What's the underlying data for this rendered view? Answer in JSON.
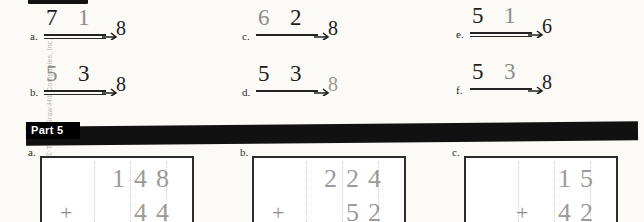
{
  "page": {
    "copyright": "Copyright © The McGraw-Hill Companies, Inc."
  },
  "part4": {
    "items": [
      {
        "label": "a.",
        "n1": "7",
        "n2": "1",
        "answer": "8",
        "n1_style": "ink",
        "n2_style": "pencil",
        "rule_style": "ink",
        "double_rule": true,
        "answer_style": "ink"
      },
      {
        "label": "b.",
        "n1": "5",
        "n2": "3",
        "answer": "8",
        "n1_style": "pencil",
        "n2_style": "ink",
        "rule_style": "ink",
        "double_rule": true,
        "answer_style": "ink"
      },
      {
        "label": "c.",
        "n1": "6",
        "n2": "2",
        "answer": "8",
        "n1_style": "pencil",
        "n2_style": "ink",
        "rule_style": "ink",
        "double_rule": false,
        "answer_style": "ink"
      },
      {
        "label": "d.",
        "n1": "5",
        "n2": "3",
        "answer": "8",
        "n1_style": "ink",
        "n2_style": "ink",
        "rule_style": "ink",
        "double_rule": false,
        "answer_style": "pencil"
      },
      {
        "label": "e.",
        "n1": "5",
        "n2": "1",
        "answer": "6",
        "n1_style": "ink",
        "n2_style": "pencil",
        "rule_style": "ink",
        "double_rule": true,
        "answer_style": "ink"
      },
      {
        "label": "f.",
        "n1": "5",
        "n2": "3",
        "answer": "8",
        "n1_style": "ink",
        "n2_style": "pencil",
        "rule_style": "ink",
        "double_rule": false,
        "answer_style": "ink"
      }
    ]
  },
  "part5": {
    "title": "Part 5",
    "items": [
      {
        "label": "a.",
        "top": "148",
        "bottom": "44",
        "operator": "+"
      },
      {
        "label": "b.",
        "top": "224",
        "bottom": "52",
        "operator": "+"
      },
      {
        "label": "c.",
        "top": "15",
        "bottom": "42",
        "operator": "+"
      }
    ]
  }
}
